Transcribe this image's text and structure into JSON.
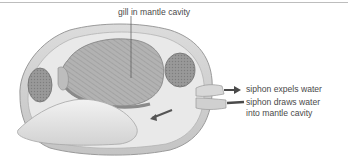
{
  "diagram": {
    "labels": {
      "gill": "gill in mantle cavity",
      "excurrent": "siphon expels water",
      "incurrent_line1": "siphon draws water",
      "incurrent_line2": "into mantle cavity"
    },
    "colors": {
      "label_text": "#4a4a4a",
      "arrow": "#4a4a4a",
      "shell": "#d6d6d6",
      "gill": "#a9a9a9",
      "muscle": "#8f8f8f",
      "foot": "#e6e6e6"
    }
  }
}
